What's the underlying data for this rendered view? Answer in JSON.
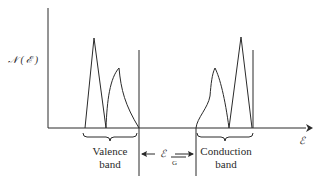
{
  "diagram": {
    "y_axis_label": "𝒩 ( ℰ )",
    "x_axis_label": "ℰ",
    "valence_band": {
      "label_line1": "Valence",
      "label_line2": "band"
    },
    "conduction_band": {
      "label_line1": "Conduction",
      "label_line2": "band"
    },
    "gap": {
      "symbol": "ℰ",
      "subscript": "G"
    }
  }
}
